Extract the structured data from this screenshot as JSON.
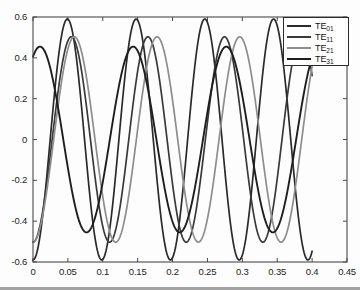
{
  "chart_data": {
    "type": "line",
    "title": "",
    "xlabel": "",
    "ylabel": "",
    "xlim": [
      0,
      0.45
    ],
    "ylim": [
      -0.6,
      0.6
    ],
    "xticks": [
      "0",
      "0.05",
      "0.1",
      "0.15",
      "0.2",
      "0.25",
      "0.3",
      "0.35",
      "0.4",
      "0.45"
    ],
    "xtick_values": [
      0,
      0.05,
      0.1,
      0.15,
      0.2,
      0.25,
      0.3,
      0.35,
      0.4,
      0.45
    ],
    "yticks": [
      "0.6",
      "0.4",
      "0.2",
      "0",
      "-0.2",
      "-0.4",
      "-0.6"
    ],
    "ytick_values": [
      0.6,
      0.4,
      0.2,
      0,
      -0.2,
      -0.4,
      -0.6
    ],
    "grid": false,
    "legend_position": "top-right",
    "x_start": 0,
    "x_end": 0.4,
    "samples": 420,
    "series": [
      {
        "name": "TE01",
        "label": "TE",
        "sub": "01",
        "color": "#2a2a2a",
        "amplitude": 0.59,
        "period": 0.0985,
        "phase_deg": -90,
        "width": 1.7
      },
      {
        "name": "TE11",
        "label": "TE",
        "sub": "11",
        "color": "#3a3a3a",
        "amplitude": 0.503,
        "period": 0.1098,
        "phase_deg": -90,
        "width": 1.7
      },
      {
        "name": "TE21",
        "label": "TE",
        "sub": "21",
        "color": "#8d8d8d",
        "amplitude": 0.503,
        "period": 0.1185,
        "phase_deg": -90,
        "width": 1.7
      },
      {
        "name": "TE31",
        "label": "TE",
        "sub": "31",
        "color": "#1e1e1e",
        "amplitude": 0.455,
        "period": 0.1335,
        "phase_deg": 63,
        "width": 1.9
      }
    ]
  },
  "axes": {
    "frame_color": "#4a4a4a",
    "background": "#fdfdfd",
    "tick_color": "#4a4a4a"
  }
}
